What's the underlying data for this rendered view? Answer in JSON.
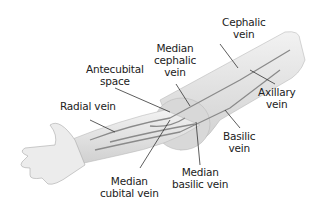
{
  "labels": {
    "cephalic_vein": [
      "Cephalic",
      "vein"
    ],
    "median_cephalic_vein": [
      "Median",
      "cephalic",
      "vein"
    ],
    "antecubital_space": [
      "Antecubital",
      "space"
    ],
    "radial_vein": [
      "Radial vein"
    ],
    "axillary_vein": [
      "Axillary",
      "vein"
    ],
    "basilic_vein": [
      "Basilic",
      "vein"
    ],
    "median_basilic_vein": [
      "Median",
      "basilic vein"
    ],
    "median_cubital_vein": [
      "Median",
      "cubital vein"
    ]
  },
  "colors": {
    "skin": "#e4e4e4",
    "skin_shade": "#c8c8c8",
    "vein": "#8a8a8a",
    "leader": "#333333"
  }
}
